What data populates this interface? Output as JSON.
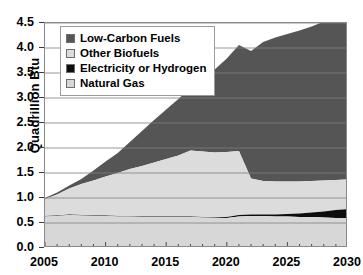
{
  "axis": {
    "ylabel": "Quadrillion Btu",
    "yticks": [
      "0.0",
      "0.5",
      "1.0",
      "1.5",
      "2.0",
      "2.5",
      "3.0",
      "3.5",
      "4.0",
      "4.5"
    ],
    "xticks": [
      "2005",
      "2010",
      "2015",
      "2020",
      "2025",
      "2030"
    ]
  },
  "legend": {
    "items": [
      {
        "label": "Low-Carbon Fuels",
        "color": "#555555",
        "name": "legend-swatch-low-carbon-fuels"
      },
      {
        "label": "Other Biofuels",
        "color": "#dcdcdc",
        "name": "legend-swatch-other-biofuels"
      },
      {
        "label": "Electricity or Hydrogen",
        "color": "#0d0d0d",
        "name": "legend-swatch-electricity-or-hydrogen"
      },
      {
        "label": "Natural Gas",
        "color": "#d7d7d7",
        "name": "legend-swatch-natural-gas"
      }
    ]
  },
  "chart_data": {
    "type": "area",
    "title": "",
    "xlabel": "",
    "ylabel": "Quadrillion Btu",
    "xlim": [
      2005,
      2030
    ],
    "ylim": [
      0.0,
      4.5
    ],
    "ytick_step": 0.5,
    "xtick_step": 5,
    "xtick_minor_step": 1,
    "grid": "horizontal",
    "legend_position": "upper-left-inside",
    "stacked": true,
    "stack_order_bottom_to_top": [
      "Natural Gas",
      "Electricity or Hydrogen",
      "Other Biofuels",
      "Low-Carbon Fuels"
    ],
    "x": [
      2005,
      2006,
      2007,
      2008,
      2009,
      2010,
      2011,
      2012,
      2013,
      2014,
      2015,
      2016,
      2017,
      2018,
      2019,
      2020,
      2021,
      2022,
      2023,
      2024,
      2025,
      2026,
      2027,
      2028,
      2029,
      2030
    ],
    "series": [
      {
        "name": "Natural Gas",
        "color": "#d7d7d7",
        "values": [
          0.63,
          0.64,
          0.66,
          0.65,
          0.64,
          0.64,
          0.63,
          0.63,
          0.62,
          0.62,
          0.62,
          0.62,
          0.62,
          0.61,
          0.6,
          0.6,
          0.63,
          0.64,
          0.64,
          0.63,
          0.63,
          0.62,
          0.62,
          0.61,
          0.6,
          0.6
        ]
      },
      {
        "name": "Electricity or Hydrogen",
        "color": "#0d0d0d",
        "values": [
          0.01,
          0.01,
          0.01,
          0.01,
          0.01,
          0.01,
          0.01,
          0.01,
          0.01,
          0.01,
          0.01,
          0.01,
          0.01,
          0.01,
          0.01,
          0.02,
          0.03,
          0.03,
          0.03,
          0.04,
          0.05,
          0.07,
          0.09,
          0.12,
          0.16,
          0.18
        ]
      },
      {
        "name": "Other Biofuels",
        "color": "#dcdcdc",
        "values": [
          0.34,
          0.42,
          0.52,
          0.62,
          0.7,
          0.78,
          0.86,
          0.94,
          1.01,
          1.08,
          1.15,
          1.22,
          1.32,
          1.31,
          1.3,
          1.3,
          1.28,
          0.72,
          0.67,
          0.66,
          0.65,
          0.64,
          0.63,
          0.62,
          0.6,
          0.59
        ]
      },
      {
        "name": "Low-Carbon Fuels",
        "color": "#555555",
        "values": [
          0.02,
          0.04,
          0.06,
          0.1,
          0.2,
          0.3,
          0.4,
          0.54,
          0.7,
          0.85,
          0.99,
          1.13,
          1.26,
          1.46,
          1.66,
          1.87,
          2.12,
          2.55,
          2.78,
          2.88,
          2.95,
          3.02,
          3.09,
          3.18,
          3.32,
          3.58
        ]
      }
    ],
    "totals": [
      1.0,
      1.11,
      1.25,
      1.38,
      1.55,
      1.73,
      1.9,
      2.12,
      2.34,
      2.56,
      2.77,
      2.98,
      3.21,
      3.39,
      3.57,
      3.79,
      4.06,
      3.94,
      4.12,
      4.21,
      4.28,
      4.35,
      4.43,
      4.53,
      4.68,
      4.35
    ],
    "cumulative_top_boundaries": {
      "natural_gas": [
        0.63,
        0.64,
        0.66,
        0.65,
        0.64,
        0.64,
        0.63,
        0.63,
        0.62,
        0.62,
        0.62,
        0.62,
        0.62,
        0.61,
        0.6,
        0.6,
        0.63,
        0.64,
        0.64,
        0.63,
        0.63,
        0.62,
        0.62,
        0.61,
        0.6,
        0.6
      ],
      "electricity_or_hydrogen": [
        0.64,
        0.65,
        0.67,
        0.66,
        0.65,
        0.65,
        0.64,
        0.64,
        0.63,
        0.63,
        0.63,
        0.63,
        0.63,
        0.62,
        0.61,
        0.62,
        0.66,
        0.67,
        0.67,
        0.67,
        0.68,
        0.69,
        0.71,
        0.73,
        0.76,
        0.78
      ],
      "other_biofuels": [
        0.98,
        1.07,
        1.19,
        1.28,
        1.35,
        1.43,
        1.5,
        1.58,
        1.64,
        1.71,
        1.78,
        1.85,
        1.95,
        1.93,
        1.91,
        1.92,
        1.94,
        1.39,
        1.34,
        1.33,
        1.33,
        1.33,
        1.34,
        1.35,
        1.36,
        1.37
      ],
      "low_carbon_fuels": [
        1.0,
        1.11,
        1.25,
        1.38,
        1.55,
        1.73,
        1.9,
        2.12,
        2.34,
        2.56,
        2.77,
        2.98,
        3.21,
        3.39,
        3.57,
        3.79,
        4.06,
        3.94,
        4.12,
        4.21,
        4.28,
        4.35,
        4.43,
        4.53,
        4.68,
        4.35
      ]
    }
  }
}
